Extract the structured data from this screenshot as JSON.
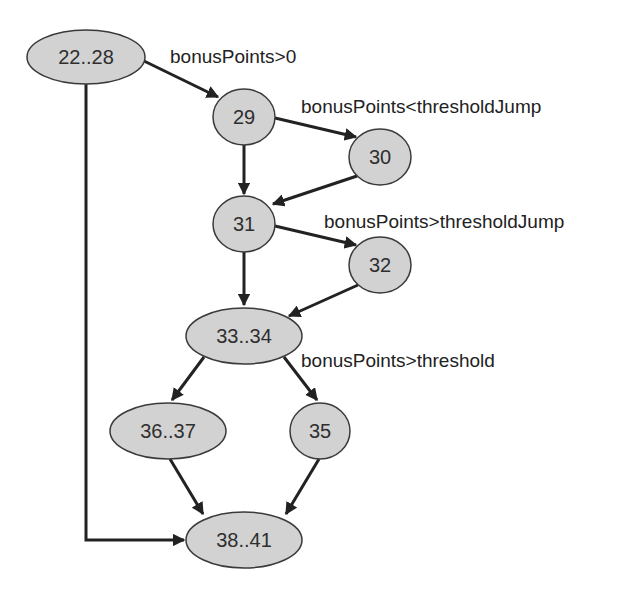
{
  "diagram": {
    "type": "control-flow-graph",
    "colors": {
      "node_fill": "#d2d2d2",
      "node_stroke": "#3a3a3a",
      "edge": "#222222",
      "text": "#2e2e2e",
      "background": "#ffffff"
    },
    "nodes": [
      {
        "id": "n22_28",
        "label": "22..28",
        "cx": 86,
        "cy": 57,
        "rx": 59,
        "ry": 27
      },
      {
        "id": "n29",
        "label": "29",
        "cx": 244,
        "cy": 117,
        "rx": 31,
        "ry": 28
      },
      {
        "id": "n30",
        "label": "30",
        "cx": 380,
        "cy": 157,
        "rx": 31,
        "ry": 28
      },
      {
        "id": "n31",
        "label": "31",
        "cx": 244,
        "cy": 224,
        "rx": 31,
        "ry": 28
      },
      {
        "id": "n32",
        "label": "32",
        "cx": 380,
        "cy": 265,
        "rx": 31,
        "ry": 28
      },
      {
        "id": "n33_34",
        "label": "33..34",
        "cx": 244,
        "cy": 336,
        "rx": 58,
        "ry": 28
      },
      {
        "id": "n36_37",
        "label": "36..37",
        "cx": 168,
        "cy": 431,
        "rx": 58,
        "ry": 28
      },
      {
        "id": "n35",
        "label": "35",
        "cx": 320,
        "cy": 431,
        "rx": 30,
        "ry": 28
      },
      {
        "id": "n38_41",
        "label": "38..41",
        "cx": 244,
        "cy": 540,
        "rx": 58,
        "ry": 28
      }
    ],
    "edges": [
      {
        "from": "22..28",
        "to": "29",
        "label": "bonusPoints>0"
      },
      {
        "from": "22..28",
        "to": "38..41",
        "label": ""
      },
      {
        "from": "29",
        "to": "30",
        "label": "bonusPoints<thresholdJump"
      },
      {
        "from": "29",
        "to": "31",
        "label": ""
      },
      {
        "from": "30",
        "to": "31",
        "label": ""
      },
      {
        "from": "31",
        "to": "32",
        "label": "bonusPoints>thresholdJump"
      },
      {
        "from": "31",
        "to": "33..34",
        "label": ""
      },
      {
        "from": "32",
        "to": "33..34",
        "label": ""
      },
      {
        "from": "33..34",
        "to": "36..37",
        "label": ""
      },
      {
        "from": "33..34",
        "to": "35",
        "label": "bonusPoints>threshold"
      },
      {
        "from": "36..37",
        "to": "38..41",
        "label": ""
      },
      {
        "from": "35",
        "to": "38..41",
        "label": ""
      }
    ],
    "edge_labels": {
      "e22_29": "bonusPoints>0",
      "e29_30": "bonusPoints<thresholdJump",
      "e31_32": "bonusPoints>thresholdJump",
      "e33_35": "bonusPoints>threshold"
    },
    "node_labels": {
      "n22_28": "22..28",
      "n29": "29",
      "n30": "30",
      "n31": "31",
      "n32": "32",
      "n33_34": "33..34",
      "n36_37": "36..37",
      "n35": "35",
      "n38_41": "38..41"
    }
  }
}
